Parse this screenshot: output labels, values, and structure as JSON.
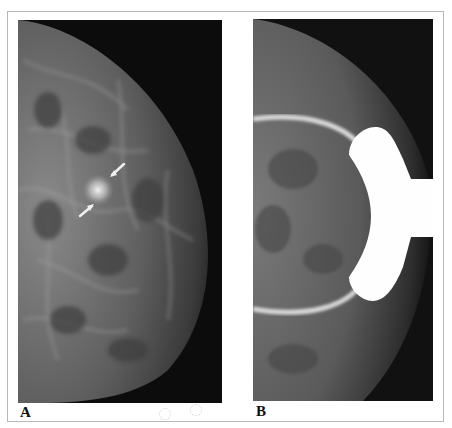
{
  "figure": {
    "panels": [
      {
        "id": "A",
        "label": "A",
        "description": "Mammogram with spiculated mass indicated by two arrows"
      },
      {
        "id": "B",
        "label": "B",
        "description": "Spot compression mammogram with compression paddle ring"
      }
    ],
    "colors": {
      "background": "#ffffff",
      "border": "#b8b8b8",
      "image_dark": "#0c0c0c",
      "tissue": "#6a6a6a",
      "paddle": "#ffffff"
    }
  }
}
